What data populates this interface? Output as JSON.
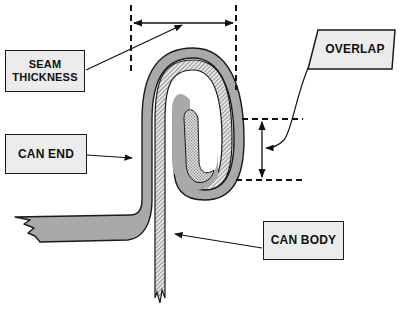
{
  "diagram": {
    "type": "double-seam-cross-section",
    "labels": {
      "seam_thickness": {
        "line1": "SEAM",
        "line2": "THICKNESS"
      },
      "overlap": "OVERLAP",
      "can_end": "CAN END",
      "can_body": "CAN BODY"
    },
    "colors": {
      "can_end_fill": "#a9a9a9",
      "label_fill": "#ececec",
      "outline": "#1a1a1a",
      "hatch": "#444444",
      "background": "#ffffff"
    }
  }
}
